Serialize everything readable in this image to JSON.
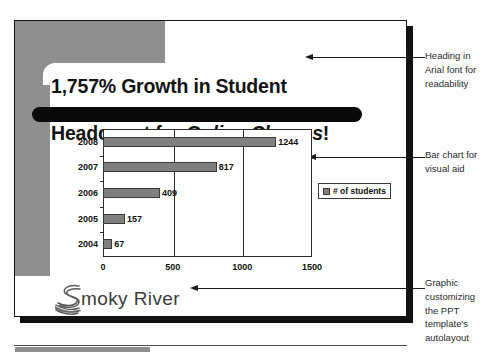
{
  "slide": {
    "title_line_1": "1,757% Growth in Student",
    "title_line_2_plain_start": "Headcount for ",
    "title_line_2_italic": "Online Classes",
    "title_line_2_plain_end": "!",
    "logo_text": "moky River",
    "logo_mark_name": "smoky-river-swirl-logo"
  },
  "chart_data": {
    "type": "bar",
    "orientation": "horizontal",
    "title": "",
    "xlabel": "",
    "ylabel": "",
    "categories": [
      "2008",
      "2007",
      "2006",
      "2005",
      "2004"
    ],
    "values": [
      1244,
      817,
      409,
      157,
      67
    ],
    "data_labels": [
      "1244",
      "817",
      "409",
      "157",
      "67"
    ],
    "series": [
      {
        "name": "# of students",
        "values": [
          1244,
          817,
          409,
          157,
          67
        ]
      }
    ],
    "legend": {
      "position": "right",
      "entries": [
        "# of students"
      ]
    },
    "xlim": [
      0,
      1500
    ],
    "xticks": [
      0,
      500,
      1000,
      1500
    ],
    "xtick_labels": [
      "0",
      "500",
      "1000",
      "1500"
    ],
    "grid": true,
    "bar_color": "#808080",
    "axis_color": "#2b2b2b"
  },
  "annotations": [
    {
      "id": "annot-1",
      "text": "Heading in\nArial font for\nreadability"
    },
    {
      "id": "annot-2",
      "text": "Bar chart for\nvisual aid"
    },
    {
      "id": "annot-3",
      "text": "Graphic\ncustomizing\nthe PPT\ntemplate's\nautolayout"
    }
  ],
  "colors": {
    "template_gray": "#8f8f8f",
    "bar_gray": "#808080",
    "ink": "#1a1a1a",
    "black_bar": "#0a0a0a"
  }
}
